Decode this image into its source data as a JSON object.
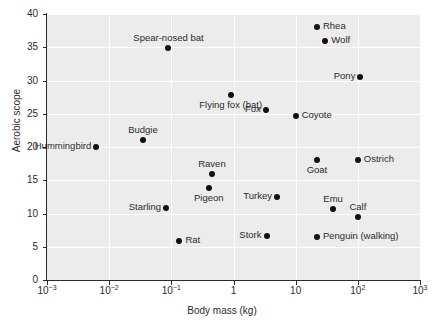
{
  "chart_data": {
    "type": "scatter",
    "title": "",
    "xlabel": "Body mass (kg)",
    "ylabel": "Aerobic scope",
    "xscale": "log",
    "yscale": "linear",
    "xlim": [
      0.001,
      1000
    ],
    "ylim": [
      0,
      40
    ],
    "grid": true,
    "legend": "none",
    "xticks": [
      0.001,
      0.01,
      0.1,
      1,
      10,
      100,
      1000
    ],
    "xtick_labels": [
      "10-3",
      "10-2",
      "10-1",
      "1",
      "10",
      "102",
      "103"
    ],
    "yticks": [
      0,
      5,
      10,
      15,
      20,
      25,
      30,
      35,
      40
    ],
    "ytick_labels": [
      "0",
      "5",
      "10",
      "15",
      "20",
      "25",
      "30",
      "35",
      "40"
    ],
    "points": [
      {
        "label": "Hummingbird",
        "x": 0.0062,
        "y": 20.0,
        "label_pos": "left"
      },
      {
        "label": "Budgie",
        "x": 0.035,
        "y": 21.0,
        "label_pos": "above"
      },
      {
        "label": "Spear-nosed bat",
        "x": 0.09,
        "y": 34.9,
        "label_pos": "above"
      },
      {
        "label": "Starling",
        "x": 0.082,
        "y": 10.8,
        "label_pos": "left"
      },
      {
        "label": "Rat",
        "x": 0.135,
        "y": 5.8,
        "label_pos": "right"
      },
      {
        "label": "Pigeon",
        "x": 0.4,
        "y": 13.9,
        "label_pos": "below"
      },
      {
        "label": "Raven",
        "x": 0.45,
        "y": 15.9,
        "label_pos": "above"
      },
      {
        "label": "Flying fox (bat)",
        "x": 0.9,
        "y": 27.8,
        "label_pos": "below"
      },
      {
        "label": "Turkey",
        "x": 5.0,
        "y": 12.5,
        "label_pos": "left"
      },
      {
        "label": "Stork",
        "x": 3.4,
        "y": 6.6,
        "label_pos": "left"
      },
      {
        "label": "Fox",
        "x": 3.3,
        "y": 25.5,
        "label_pos": "left"
      },
      {
        "label": "Coyote",
        "x": 10.0,
        "y": 24.7,
        "label_pos": "right"
      },
      {
        "label": "Rhea",
        "x": 22.0,
        "y": 38.0,
        "label_pos": "right"
      },
      {
        "label": "Wolf",
        "x": 30.0,
        "y": 36.0,
        "label_pos": "right"
      },
      {
        "label": "Pony",
        "x": 110.0,
        "y": 30.5,
        "label_pos": "left"
      },
      {
        "label": "Goat",
        "x": 22.0,
        "y": 18.0,
        "label_pos": "below"
      },
      {
        "label": "Ostrich",
        "x": 100.0,
        "y": 18.0,
        "label_pos": "right"
      },
      {
        "label": "Emu",
        "x": 40.0,
        "y": 10.7,
        "label_pos": "above"
      },
      {
        "label": "Calf",
        "x": 100.0,
        "y": 9.5,
        "label_pos": "above"
      },
      {
        "label": "Penguin (walking)",
        "x": 22.0,
        "y": 6.5,
        "label_pos": "right"
      }
    ]
  }
}
